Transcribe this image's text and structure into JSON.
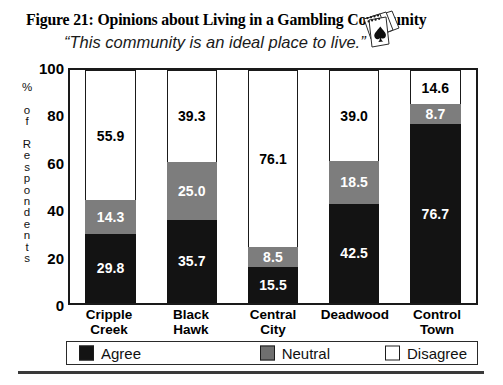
{
  "figure": {
    "title": "Figure 21:  Opinions about Living in a Gambling Community",
    "subtitle": "“This community is an ideal place to live.”",
    "decoration_icon": "playing-cards-spade-icon"
  },
  "axes": {
    "y_title_chars": [
      "%",
      "",
      "o",
      "f",
      "",
      "R",
      "e",
      "s",
      "p",
      "o",
      "n",
      "d",
      "e",
      "n",
      "t",
      "s"
    ],
    "y_ticks": [
      "0",
      "20",
      "40",
      "60",
      "80",
      "100"
    ]
  },
  "legend": {
    "items": [
      {
        "label": "Agree",
        "color": "#131313",
        "swatch": "sw-agree"
      },
      {
        "label": "Neutral",
        "color": "#6f6f6f",
        "swatch": "sw-neutral"
      },
      {
        "label": "Disagree",
        "color": "#ffffff",
        "swatch": "sw-disagree"
      }
    ]
  },
  "chart_data": {
    "type": "bar",
    "subtype": "stacked-bar-100",
    "title": "Figure 21:  Opinions about Living in a Gambling Community",
    "subtitle": "“This community is an ideal place to live.”",
    "xlabel": "",
    "ylabel": "% of Respondents",
    "ylim": [
      0,
      100
    ],
    "yticks": [
      0,
      20,
      40,
      60,
      80,
      100
    ],
    "grid": false,
    "legend_position": "bottom",
    "categories": [
      "Cripple Creek",
      "Black Hawk",
      "Central City",
      "Deadwood",
      "Control Town"
    ],
    "category_lines": [
      [
        "Cripple",
        "Creek"
      ],
      [
        "Black",
        "Hawk"
      ],
      [
        "Central",
        "City"
      ],
      [
        "Deadwood",
        ""
      ],
      [
        "Control",
        "Town"
      ]
    ],
    "series": [
      {
        "name": "Agree",
        "color": "#131313",
        "values": [
          29.8,
          35.7,
          15.5,
          42.5,
          76.7
        ]
      },
      {
        "name": "Neutral",
        "color": "#7d7d7d",
        "values": [
          14.3,
          25.0,
          8.5,
          18.5,
          8.7
        ]
      },
      {
        "name": "Disagree",
        "color": "#ffffff",
        "values": [
          55.9,
          39.3,
          76.1,
          39.0,
          14.6
        ]
      }
    ],
    "data_labels": [
      {
        "category": "Cripple Creek",
        "Agree": "29.8",
        "Neutral": "14.3",
        "Disagree": "55.9"
      },
      {
        "category": "Black Hawk",
        "Agree": "35.7",
        "Neutral": "25.0",
        "Disagree": "39.3"
      },
      {
        "category": "Central City",
        "Agree": "15.5",
        "Neutral": "8.5",
        "Disagree": "76.1"
      },
      {
        "category": "Deadwood",
        "Agree": "42.5",
        "Neutral": "18.5",
        "Disagree": "39.0"
      },
      {
        "category": "Control Town",
        "Agree": "76.7",
        "Neutral": "8.7",
        "Disagree": "14.6"
      }
    ]
  }
}
